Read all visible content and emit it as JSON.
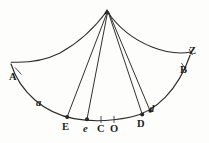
{
  "figure": {
    "kind": "geometric-diagram",
    "ink_color": "#2b2b2b",
    "background_color": "#fdfdfc",
    "width": 209,
    "height": 143
  },
  "labels": {
    "A": "A",
    "B": "B",
    "Z": "Z",
    "a": "a",
    "d": "d",
    "E": "E",
    "e": "e",
    "C": "C",
    "O": "O",
    "D": "D"
  },
  "geometry": {
    "apex": {
      "x": 107,
      "y": 11
    },
    "left_cheek": {
      "start_x": 107,
      "start_y": 11,
      "end_x": 11,
      "end_y": 62
    },
    "right_cheek": {
      "start_x": 107,
      "start_y": 11,
      "end_x": 191,
      "end_y": 52
    },
    "lower_arc": {
      "start_x": 11,
      "start_y": 64,
      "end_x": 190,
      "end_y": 55
    },
    "radials": [
      {
        "name": "apex-to-E",
        "to_x": 67,
        "to_y": 117
      },
      {
        "name": "apex-to-e",
        "to_x": 87,
        "to_y": 119
      },
      {
        "name": "apex-to-D",
        "to_x": 142,
        "to_y": 114
      },
      {
        "name": "apex-to-d",
        "to_x": 150,
        "to_y": 111
      }
    ],
    "marked_points": [
      {
        "name": "E",
        "x": 67,
        "y": 117
      },
      {
        "name": "e",
        "x": 87,
        "y": 119
      },
      {
        "name": "D",
        "x": 142,
        "y": 114
      },
      {
        "name": "d",
        "x": 150,
        "y": 111
      }
    ],
    "tick_points": [
      {
        "name": "A",
        "x": 18,
        "y": 71
      },
      {
        "name": "B",
        "x": 184,
        "y": 67
      },
      {
        "name": "C",
        "x": 101,
        "y": 119
      },
      {
        "name": "O",
        "x": 114,
        "y": 119
      }
    ]
  }
}
